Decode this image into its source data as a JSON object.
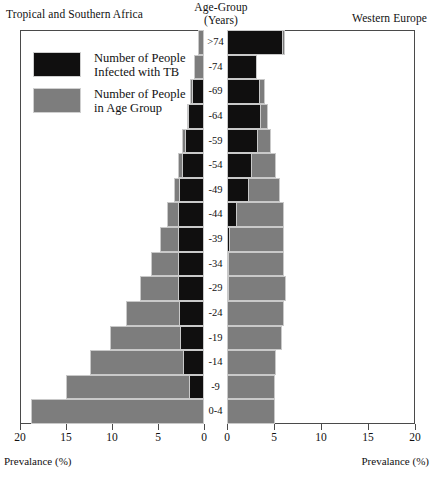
{
  "headers": {
    "left": "Tropical and Southern Africa",
    "right": "Western Europe",
    "center_line1": "Age-Group",
    "center_line2": "(Years)"
  },
  "legend": {
    "items": [
      {
        "swatch": "black",
        "line1": "Number of People",
        "line2": "Infected with TB"
      },
      {
        "swatch": "gray",
        "line1": "Number of People",
        "line2": "in Age Group"
      }
    ]
  },
  "axis": {
    "caption_left": "Prevalance (%)",
    "caption_right": "Prevalance (%)",
    "ticks_left": [
      "20",
      "15",
      "10",
      "5",
      "0"
    ],
    "ticks_right": [
      "0",
      "5",
      "10",
      "15",
      "20"
    ]
  },
  "colors": {
    "tb_bar": "#100f0f",
    "age_bar": "#7d7d7d",
    "frame": "#4a4a4a",
    "background": "#ffffff"
  },
  "chart_data": {
    "type": "bar",
    "subtype": "population-pyramid",
    "title": "",
    "xlabel": "Prevalance (%)",
    "ylabel": "Age-Group (Years)",
    "xlim_left": [
      20,
      0
    ],
    "xlim_right": [
      0,
      20
    ],
    "grid": false,
    "legend_position": "upper-left",
    "categories": [
      ">74",
      "-74",
      "-69",
      "-64",
      "-59",
      "-54",
      "-49",
      "-44",
      "-39",
      "-34",
      "-29",
      "-24",
      "-19",
      "-14",
      "-9",
      "0-4"
    ],
    "panels": [
      {
        "name": "Tropical and Southern Africa",
        "side": "left",
        "series": [
          {
            "name": "Number of People in Age Group",
            "values": [
              0.6,
              1.1,
              1.5,
              1.9,
              2.4,
              2.8,
              3.3,
              4.0,
              4.8,
              5.8,
              7.0,
              8.5,
              10.2,
              12.4,
              15.0,
              18.8
            ]
          },
          {
            "name": "Number of People Infected with TB",
            "values": [
              0.0,
              0.0,
              1.3,
              1.7,
              2.1,
              2.4,
              2.7,
              2.8,
              2.8,
              2.8,
              2.8,
              2.7,
              2.6,
              2.3,
              1.6,
              0.0
            ]
          }
        ]
      },
      {
        "name": "Western Europe",
        "side": "right",
        "series": [
          {
            "name": "Number of People in Age Group",
            "values": [
              6.2,
              3.2,
              4.0,
              4.4,
              4.7,
              5.2,
              5.6,
              6.1,
              6.1,
              6.1,
              6.3,
              6.1,
              5.8,
              5.2,
              5.1,
              5.1
            ]
          },
          {
            "name": "Number of People Infected with TB",
            "values": [
              6.0,
              3.2,
              3.5,
              3.6,
              3.3,
              2.7,
              2.3,
              1.1,
              0.35,
              0.25,
              0.2,
              0.0,
              0.0,
              0.0,
              0.0,
              0.0
            ]
          }
        ]
      }
    ]
  }
}
